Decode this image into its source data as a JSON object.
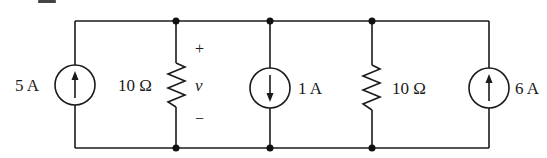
{
  "diagram": {
    "type": "electrical-circuit",
    "colors": {
      "ink": "#1a1a1a",
      "background": "#ffffff"
    },
    "components": [
      {
        "id": "src1",
        "kind": "current-source",
        "direction": "up",
        "label": "5 A"
      },
      {
        "id": "r1",
        "kind": "resistor",
        "label": "10 Ω",
        "voltage_label": "v",
        "plus": "+",
        "minus": "−"
      },
      {
        "id": "src2",
        "kind": "current-source",
        "direction": "down",
        "label": "1 A"
      },
      {
        "id": "r2",
        "kind": "resistor",
        "label": "10 Ω"
      },
      {
        "id": "src3",
        "kind": "current-source",
        "direction": "up",
        "label": "6 A"
      }
    ],
    "nodes_count": 6
  }
}
